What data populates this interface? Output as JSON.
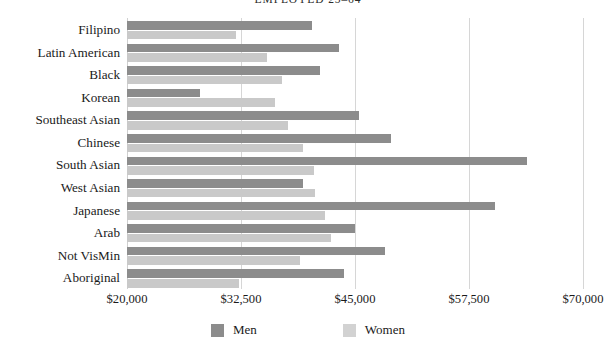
{
  "chart_data": {
    "type": "bar",
    "orientation": "horizontal",
    "title": "EMPLOYED 25–64",
    "xlabel": "",
    "ylabel": "",
    "xlim": [
      20000,
      70000
    ],
    "xticks": [
      "$20,000",
      "$32,500",
      "$45,000",
      "$57,500",
      "$70,000"
    ],
    "xtick_values": [
      20000,
      32500,
      45000,
      57500,
      70000
    ],
    "grid": "vertical",
    "legend_position": "bottom",
    "categories": [
      "Filipino",
      "Latin American",
      "Black",
      "Korean",
      "Southeast Asian",
      "Chinese",
      "South Asian",
      "West Asian",
      "Japanese",
      "Arab",
      "Not VisMin",
      "Aboriginal"
    ],
    "series": [
      {
        "name": "Men",
        "color": "#8c8c8c",
        "values": [
          40300,
          43300,
          41200,
          28000,
          45400,
          48900,
          63900,
          39300,
          60400,
          45000,
          48300,
          43800
        ]
      },
      {
        "name": "Women",
        "color": "#c9c9c9",
        "values": [
          31900,
          35300,
          37000,
          36200,
          37700,
          39300,
          40500,
          40600,
          41700,
          42400,
          39000,
          32300
        ]
      }
    ]
  },
  "legend": {
    "men_label": "Men",
    "women_label": "Women"
  }
}
